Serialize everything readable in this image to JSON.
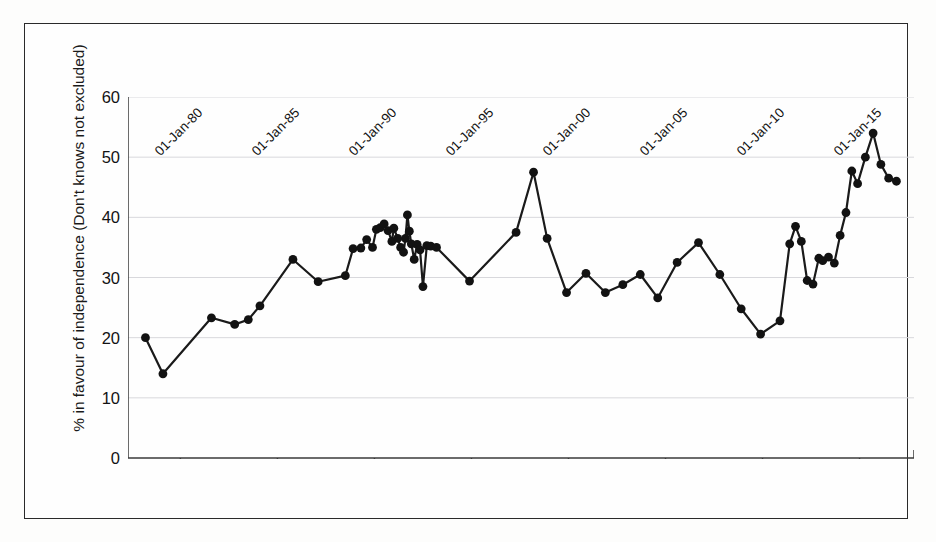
{
  "chart_data": {
    "type": "line",
    "title": "",
    "xlabel": "",
    "ylabel": "% in favour of independence (Don't knows not excluded)",
    "ylim": [
      0,
      60
    ],
    "yticks": [
      0,
      10,
      20,
      30,
      40,
      50,
      60
    ],
    "xlim": [
      "1978-01-01",
      "1917-01-01"
    ],
    "xtick_labels": [
      "01-Jan-80",
      "01-Jan-85",
      "01-Jan-90",
      "01-Jan-95",
      "01-Jan-00",
      "01-Jan-05",
      "01-Jan-10",
      "01-Jan-15"
    ],
    "xtick_years": [
      1980,
      1985,
      1990,
      1995,
      2000,
      2005,
      2010,
      2015
    ],
    "grid": "horizontal",
    "legend": "none",
    "marker": "filled-circle",
    "line_color": "#1a1a1a",
    "marker_color": "#121212",
    "grid_color": "#d8d8dc",
    "series": [
      {
        "name": "% in favour of independence",
        "x": [
          1978.2,
          1979.1,
          1981.6,
          1982.8,
          1983.5,
          1984.1,
          1985.8,
          1987.1,
          1988.5,
          1988.9,
          1989.3,
          1989.6,
          1989.9,
          1990.1,
          1990.3,
          1990.5,
          1990.7,
          1990.9,
          1991.0,
          1991.2,
          1991.35,
          1991.5,
          1991.6,
          1991.7,
          1991.8,
          1991.9,
          1992.05,
          1992.2,
          1992.35,
          1992.5,
          1992.7,
          1992.9,
          1993.2,
          1994.9,
          1997.3,
          1998.2,
          1998.9,
          1999.9,
          2000.9,
          2001.9,
          2002.8,
          2003.7,
          2004.6,
          2005.6,
          2006.7,
          2007.8,
          2008.9,
          2009.9,
          2010.9,
          2011.4,
          2011.7,
          2012.0,
          2012.3,
          2012.6,
          2012.9,
          2013.1,
          2013.4,
          2013.7,
          2014.0,
          2014.3,
          2014.6,
          2014.9,
          2015.3,
          2015.7,
          2016.1,
          2016.5,
          2016.9
        ],
        "y": [
          20.0,
          14.0,
          23.3,
          22.2,
          23.0,
          25.3,
          33.0,
          29.3,
          30.3,
          34.8,
          34.9,
          36.3,
          35.0,
          38.0,
          38.3,
          38.9,
          37.8,
          36.0,
          38.2,
          36.5,
          35.0,
          34.2,
          36.5,
          40.4,
          37.7,
          35.6,
          33.0,
          35.5,
          34.6,
          28.5,
          35.3,
          35.2,
          35.0,
          29.4,
          37.5,
          47.5,
          36.5,
          27.5,
          30.7,
          27.5,
          28.8,
          30.5,
          26.6,
          32.5,
          35.8,
          30.5,
          24.8,
          20.6,
          22.8,
          35.6,
          38.5,
          36.0,
          29.5,
          28.9,
          33.2,
          32.8,
          33.4,
          32.4,
          37.0,
          40.8,
          47.7,
          45.6,
          50.0,
          54.0,
          48.8,
          46.5,
          46.0
        ]
      }
    ]
  },
  "figure": {
    "border_color": "#2a2a2a",
    "background": "#fefefe"
  }
}
